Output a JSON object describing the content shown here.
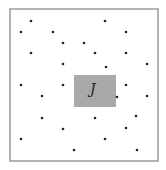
{
  "diagram": {
    "frame": {
      "x": 10,
      "y": 9,
      "width": 148,
      "height": 152,
      "stroke": "#8a8a8a"
    },
    "region": {
      "label": "J",
      "x": 74,
      "y": 75,
      "width": 42,
      "height": 32,
      "fill": "#a9a9a9"
    },
    "dot_color": "#222222",
    "dots": [
      [
        31,
        21
      ],
      [
        105,
        21
      ],
      [
        21,
        32
      ],
      [
        53,
        32
      ],
      [
        126,
        32
      ],
      [
        63,
        43
      ],
      [
        84,
        43
      ],
      [
        31,
        53
      ],
      [
        95,
        53
      ],
      [
        126,
        53
      ],
      [
        63,
        64
      ],
      [
        106,
        67
      ],
      [
        147,
        64
      ],
      [
        21,
        85
      ],
      [
        63,
        85
      ],
      [
        126,
        85
      ],
      [
        42,
        96
      ],
      [
        117,
        97
      ],
      [
        147,
        96
      ],
      [
        42,
        118
      ],
      [
        95,
        118
      ],
      [
        136,
        116
      ],
      [
        63,
        129
      ],
      [
        126,
        128
      ],
      [
        21,
        139
      ],
      [
        105,
        139
      ],
      [
        74,
        150
      ],
      [
        137,
        150
      ]
    ]
  }
}
